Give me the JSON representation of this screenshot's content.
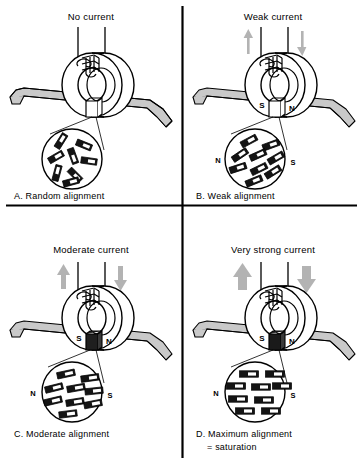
{
  "figure": {
    "name": "magnetic-tape-domain-alignment",
    "panel_count": 4,
    "divider_color": "#000000",
    "tape_color": "#c9c9c9",
    "arrow_color": "#b3b3b3",
    "domain_fill": "#1a1a1a",
    "line_color": "#000000"
  },
  "panels": [
    {
      "id": "A",
      "title": "No current",
      "caption": "A.  Random alignment",
      "caption_line2": "",
      "arrows": {
        "visible": false,
        "weight": 0,
        "left_dir": "up",
        "right_dir": "down"
      },
      "poles": {
        "visible": false,
        "left": "S",
        "right": "N"
      },
      "circle_poles": {
        "visible": false,
        "left": "N",
        "right": "S"
      },
      "domains": {
        "alignment": "random",
        "count": 8,
        "angles": [
          -58,
          22,
          -30,
          70,
          8,
          -75,
          45,
          -15
        ]
      }
    },
    {
      "id": "B",
      "title": "Weak current",
      "caption": "B.  Weak alignment",
      "caption_line2": "",
      "arrows": {
        "visible": true,
        "weight": 1,
        "left_dir": "up",
        "right_dir": "down"
      },
      "poles": {
        "visible": true,
        "left": "S",
        "right": "N"
      },
      "circle_poles": {
        "visible": true,
        "left": "N",
        "right": "S"
      },
      "domains": {
        "alignment": "weak",
        "count": 9,
        "angles": [
          -28,
          -20,
          -34,
          -24,
          -30,
          -18,
          -26,
          -32,
          -22
        ]
      }
    },
    {
      "id": "C",
      "title": "Moderate current",
      "caption": "C.  Moderate alignment",
      "caption_line2": "",
      "arrows": {
        "visible": true,
        "weight": 2,
        "left_dir": "up",
        "right_dir": "down"
      },
      "poles": {
        "visible": true,
        "left": "S",
        "right": "N"
      },
      "circle_poles": {
        "visible": true,
        "left": "N",
        "right": "S"
      },
      "domains": {
        "alignment": "moderate",
        "count": 9,
        "angles": [
          -12,
          -8,
          -14,
          -10,
          -6,
          -13,
          -9,
          -11,
          -7
        ]
      }
    },
    {
      "id": "D",
      "title": "Very strong current",
      "caption": "D.  Maximum alignment",
      "caption_line2": "=  saturation",
      "arrows": {
        "visible": true,
        "weight": 3,
        "left_dir": "up",
        "right_dir": "down"
      },
      "poles": {
        "visible": true,
        "left": "S",
        "right": "N"
      },
      "circle_poles": {
        "visible": true,
        "left": "N",
        "right": "S"
      },
      "domains": {
        "alignment": "maximum",
        "count": 9,
        "angles": [
          0,
          0,
          0,
          0,
          0,
          0,
          0,
          0,
          0
        ]
      }
    }
  ]
}
